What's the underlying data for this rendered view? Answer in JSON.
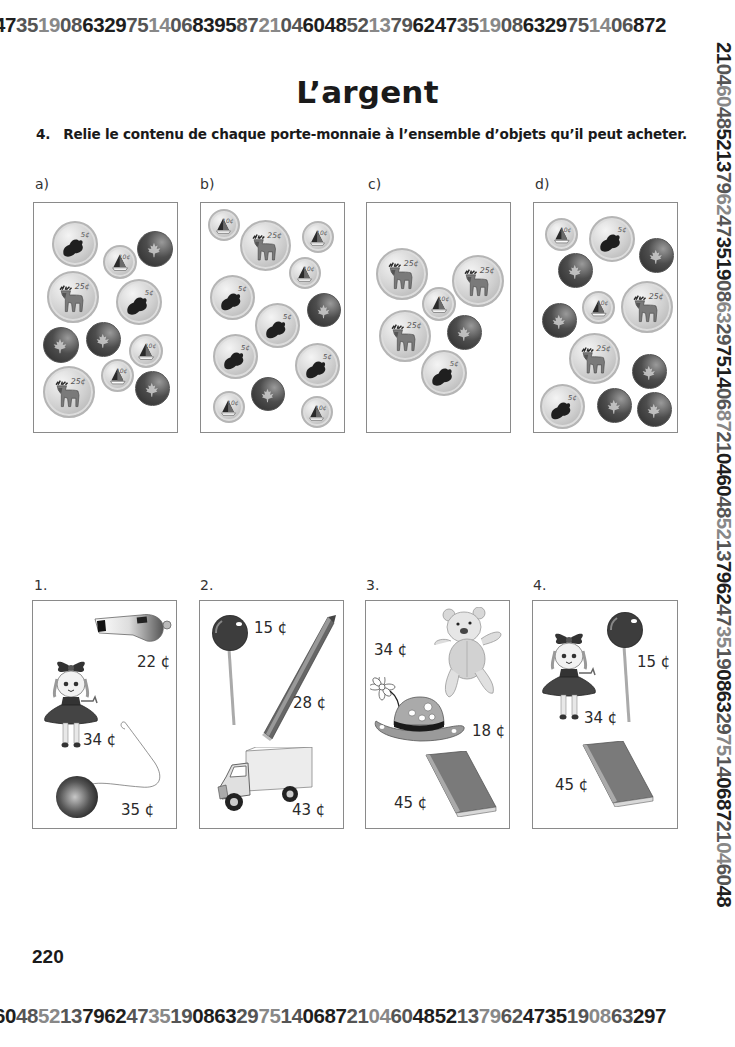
{
  "border": {
    "top_digits": "47351908632975140683958721046048521379624735190863297514068 72",
    "bottom_digits": "60485213796247351908632975140687210460485213796247351908632 97",
    "right_digits": "2104604852137962473519086329751406872104604852137962473519086329751406872104604 8",
    "left_digits": "1046048521379624735190863297514068721046048521379624735190863297514068721046048521379"
  },
  "title": "L’argent",
  "instruction": {
    "number": "4.",
    "text": "Relie le contenu de chaque porte-monnaie à l’ensemble d’objets qu’il peut acheter."
  },
  "wallets": [
    {
      "label": "a)",
      "label_pos": [
        35,
        176
      ],
      "box": [
        33,
        202,
        145,
        231
      ],
      "coins": [
        {
          "type": "5",
          "value_label": "5¢",
          "x": 18,
          "y": 18,
          "size": 46
        },
        {
          "type": "10",
          "value_label": "10¢",
          "x": 69,
          "y": 42,
          "size": 34
        },
        {
          "type": "1",
          "value_label": "1¢",
          "x": 103,
          "y": 28,
          "size": 36
        },
        {
          "type": "25",
          "value_label": "25¢",
          "x": 13,
          "y": 68,
          "size": 52
        },
        {
          "type": "5",
          "value_label": "5¢",
          "x": 82,
          "y": 76,
          "size": 46
        },
        {
          "type": "1",
          "value_label": "1¢",
          "x": 9,
          "y": 124,
          "size": 36
        },
        {
          "type": "1",
          "value_label": "1¢",
          "x": 52,
          "y": 119,
          "size": 35
        },
        {
          "type": "10",
          "value_label": "10¢",
          "x": 95,
          "y": 131,
          "size": 34
        },
        {
          "type": "25",
          "value_label": "25¢",
          "x": 9,
          "y": 163,
          "size": 52
        },
        {
          "type": "10",
          "value_label": "10¢",
          "x": 67,
          "y": 156,
          "size": 33
        },
        {
          "type": "1",
          "value_label": "1¢",
          "x": 101,
          "y": 168,
          "size": 35
        }
      ]
    },
    {
      "label": "b)",
      "label_pos": [
        200,
        176
      ],
      "box": [
        200,
        202,
        145,
        231
      ],
      "coins": [
        {
          "type": "10",
          "value_label": "10¢",
          "x": 7,
          "y": 6,
          "size": 32
        },
        {
          "type": "25",
          "value_label": "25¢",
          "x": 39,
          "y": 17,
          "size": 51
        },
        {
          "type": "10",
          "value_label": "10¢",
          "x": 101,
          "y": 18,
          "size": 32
        },
        {
          "type": "10",
          "value_label": "10¢",
          "x": 88,
          "y": 54,
          "size": 32
        },
        {
          "type": "5",
          "value_label": "5¢",
          "x": 9,
          "y": 72,
          "size": 45
        },
        {
          "type": "1",
          "value_label": "1¢",
          "x": 106,
          "y": 90,
          "size": 34
        },
        {
          "type": "5",
          "value_label": "5¢",
          "x": 54,
          "y": 100,
          "size": 45
        },
        {
          "type": "5",
          "value_label": "5¢",
          "x": 12,
          "y": 131,
          "size": 45
        },
        {
          "type": "5",
          "value_label": "5¢",
          "x": 94,
          "y": 140,
          "size": 45
        },
        {
          "type": "1",
          "value_label": "1¢",
          "x": 50,
          "y": 174,
          "size": 34
        },
        {
          "type": "10",
          "value_label": "10¢",
          "x": 12,
          "y": 188,
          "size": 32
        },
        {
          "type": "10",
          "value_label": "10¢",
          "x": 100,
          "y": 193,
          "size": 32
        }
      ]
    },
    {
      "label": "c)",
      "label_pos": [
        368,
        176
      ],
      "box": [
        366,
        202,
        145,
        231
      ],
      "coins": [
        {
          "type": "25",
          "value_label": "25¢",
          "x": 9,
          "y": 45,
          "size": 52
        },
        {
          "type": "25",
          "value_label": "25¢",
          "x": 85,
          "y": 52,
          "size": 52
        },
        {
          "type": "10",
          "value_label": "10¢",
          "x": 55,
          "y": 84,
          "size": 34
        },
        {
          "type": "25",
          "value_label": "25¢",
          "x": 12,
          "y": 107,
          "size": 52
        },
        {
          "type": "1",
          "value_label": "1¢",
          "x": 80,
          "y": 112,
          "size": 35
        },
        {
          "type": "5",
          "value_label": "5¢",
          "x": 54,
          "y": 147,
          "size": 46
        }
      ]
    },
    {
      "label": "d)",
      "label_pos": [
        535,
        176
      ],
      "box": [
        533,
        202,
        145,
        231
      ],
      "coins": [
        {
          "type": "10",
          "value_label": "10¢",
          "x": 11,
          "y": 15,
          "size": 33
        },
        {
          "type": "5",
          "value_label": "5¢",
          "x": 55,
          "y": 13,
          "size": 46
        },
        {
          "type": "1",
          "value_label": "1¢",
          "x": 105,
          "y": 35,
          "size": 35
        },
        {
          "type": "1",
          "value_label": "1¢",
          "x": 24,
          "y": 50,
          "size": 35
        },
        {
          "type": "10",
          "value_label": "10¢",
          "x": 48,
          "y": 88,
          "size": 33
        },
        {
          "type": "25",
          "value_label": "25¢",
          "x": 87,
          "y": 78,
          "size": 52
        },
        {
          "type": "1",
          "value_label": "1¢",
          "x": 8,
          "y": 100,
          "size": 35
        },
        {
          "type": "25",
          "value_label": "25¢",
          "x": 35,
          "y": 130,
          "size": 51
        },
        {
          "type": "1",
          "value_label": "1¢",
          "x": 98,
          "y": 151,
          "size": 35
        },
        {
          "type": "5",
          "value_label": "5¢",
          "x": 6,
          "y": 181,
          "size": 45
        },
        {
          "type": "1",
          "value_label": "1¢",
          "x": 63,
          "y": 185,
          "size": 35
        },
        {
          "type": "1",
          "value_label": "1¢",
          "x": 103,
          "y": 189,
          "size": 35
        }
      ]
    }
  ],
  "item_sets": [
    {
      "label": "1.",
      "label_pos": [
        34,
        577
      ],
      "box": [
        32,
        600,
        145,
        229
      ],
      "items": [
        {
          "name": "whistle",
          "price": "22 ¢",
          "x": 60,
          "y": 12,
          "w": 80,
          "h": 30,
          "px": 104,
          "py": 52
        },
        {
          "name": "doll",
          "price": "34 ¢",
          "x": 8,
          "y": 58,
          "w": 70,
          "h": 95,
          "px": 50,
          "py": 130
        },
        {
          "name": "yo-yo",
          "price": "35 ¢",
          "x": 18,
          "y": 118,
          "w": 120,
          "h": 102,
          "px": 88,
          "py": 200
        }
      ]
    },
    {
      "label": "2.",
      "label_pos": [
        200,
        577
      ],
      "box": [
        199,
        600,
        145,
        229
      ],
      "items": [
        {
          "name": "lollipop",
          "price": "15 ¢",
          "x": 10,
          "y": 12,
          "w": 42,
          "h": 115,
          "px": 54,
          "py": 18
        },
        {
          "name": "pencil",
          "price": "28 ¢",
          "x": 58,
          "y": 12,
          "w": 82,
          "h": 130,
          "px": 93,
          "py": 93
        },
        {
          "name": "truck",
          "price": "43 ¢",
          "x": 16,
          "y": 146,
          "w": 100,
          "h": 68,
          "px": 92,
          "py": 200
        }
      ]
    },
    {
      "label": "3.",
      "label_pos": [
        366,
        577
      ],
      "box": [
        365,
        600,
        145,
        229
      ],
      "items": [
        {
          "name": "teddy-bear",
          "price": "34 ¢",
          "x": 65,
          "y": 6,
          "w": 75,
          "h": 95,
          "px": 8,
          "py": 40
        },
        {
          "name": "hat-with-flower",
          "price": "18 ¢",
          "x": 4,
          "y": 76,
          "w": 100,
          "h": 68,
          "px": 106,
          "py": 121
        },
        {
          "name": "book",
          "price": "45 ¢",
          "x": 58,
          "y": 150,
          "w": 74,
          "h": 66,
          "px": 28,
          "py": 193
        }
      ]
    },
    {
      "label": "4.",
      "label_pos": [
        533,
        577
      ],
      "box": [
        532,
        600,
        146,
        229
      ],
      "items": [
        {
          "name": "doll",
          "price": "34 ¢",
          "x": 6,
          "y": 30,
          "w": 70,
          "h": 95,
          "px": 51,
          "py": 108
        },
        {
          "name": "lollipop",
          "price": "15 ¢",
          "x": 72,
          "y": 9,
          "w": 42,
          "h": 115,
          "px": 104,
          "py": 52
        },
        {
          "name": "book",
          "price": "45 ¢",
          "x": 48,
          "y": 140,
          "w": 74,
          "h": 66,
          "px": 22,
          "py": 175
        }
      ]
    }
  ],
  "page_number": "220",
  "colors": {
    "text": "#1a1a1a",
    "box_border": "#8a8a8a",
    "silver_coin": "#c8c8c8",
    "copper_coin": "#3a3a3a"
  }
}
